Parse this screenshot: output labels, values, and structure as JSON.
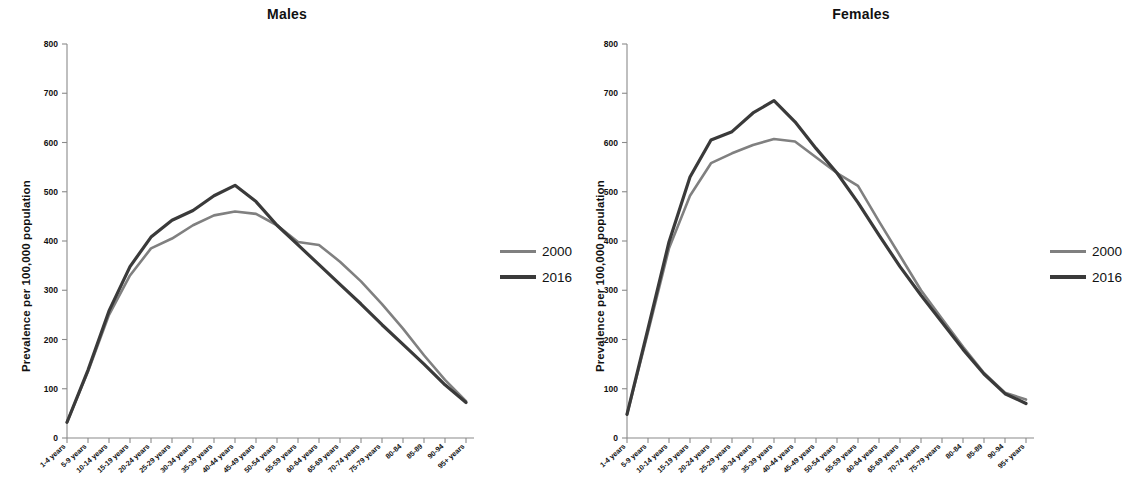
{
  "figure": {
    "ylabel": "Prevalence per 100,000 population",
    "legend": {
      "items": [
        {
          "label": "2000",
          "color": "#808080"
        },
        {
          "label": "2016",
          "color": "#3a3a3a"
        }
      ]
    }
  },
  "panels": [
    {
      "title": "Males"
    },
    {
      "title": "Females"
    }
  ],
  "chart_data": [
    {
      "type": "line",
      "title": "Males",
      "xlabel": "",
      "ylabel": "Prevalence per 100,000 population",
      "ylim": [
        0,
        800
      ],
      "yticks": [
        0,
        100,
        200,
        300,
        400,
        500,
        600,
        700,
        800
      ],
      "grid": false,
      "legend_position": "right",
      "categories": [
        "1-4 years",
        "5-9 years",
        "10-14 years",
        "15-19 years",
        "20-24 years",
        "25-29 years",
        "30-34 years",
        "35-39 years",
        "40-44 years",
        "45-49 years",
        "50-54 years",
        "55-59 years",
        "60-64 years",
        "65-69 years",
        "70-74 years",
        "75-79 years",
        "80-84",
        "85-89",
        "90-94",
        "95+ years"
      ],
      "series": [
        {
          "name": "2000",
          "color": "#808080",
          "values": [
            32,
            135,
            250,
            330,
            385,
            405,
            432,
            452,
            460,
            455,
            432,
            398,
            392,
            358,
            318,
            272,
            222,
            168,
            118,
            75
          ]
        },
        {
          "name": "2016",
          "color": "#3a3a3a",
          "values": [
            32,
            138,
            258,
            348,
            408,
            442,
            462,
            492,
            513,
            480,
            432,
            392,
            352,
            312,
            272,
            230,
            190,
            150,
            108,
            72
          ]
        }
      ]
    },
    {
      "type": "line",
      "title": "Females",
      "xlabel": "",
      "ylabel": "Prevalence per 100,000 population",
      "ylim": [
        0,
        800
      ],
      "yticks": [
        0,
        100,
        200,
        300,
        400,
        500,
        600,
        700,
        800
      ],
      "grid": false,
      "legend_position": "right",
      "categories": [
        "1-4 years",
        "5-9 years",
        "10-14 years",
        "15-19 years",
        "20-24 years",
        "25-29 years",
        "30-34 years",
        "35-39 years",
        "40-44 years",
        "45-49 years",
        "50-54 years",
        "55-59 years",
        "60-64 years",
        "65-69 years",
        "70-74 years",
        "75-79 years",
        "80-84",
        "85-89",
        "90-94",
        "95+ years"
      ],
      "series": [
        {
          "name": "2000",
          "color": "#808080",
          "values": [
            48,
            215,
            385,
            492,
            558,
            578,
            595,
            607,
            602,
            570,
            538,
            512,
            440,
            370,
            300,
            242,
            185,
            132,
            92,
            78
          ]
        },
        {
          "name": "2016",
          "color": "#3a3a3a",
          "values": [
            48,
            222,
            398,
            530,
            605,
            622,
            660,
            685,
            642,
            588,
            538,
            478,
            412,
            348,
            290,
            235,
            180,
            130,
            90,
            70
          ]
        }
      ]
    }
  ]
}
